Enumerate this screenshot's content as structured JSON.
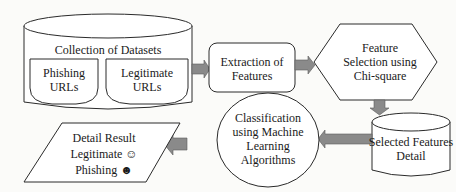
{
  "diagram": {
    "type": "flowchart",
    "colors": {
      "stroke": "#2a2a2a",
      "arrow_fill": "#8a8a8a",
      "background": "#fbfbf9"
    },
    "nodes": {
      "datasets": {
        "title": "Collection of Datasets",
        "shape": "cylinder",
        "children": {
          "phishing": {
            "line1": "Phishing",
            "line2": "URLs"
          },
          "legitimate": {
            "line1": "Legitimate",
            "line2": "URLs"
          }
        }
      },
      "extraction": {
        "line1": "Extraction of",
        "line2": "Features",
        "shape": "rounded-rectangle"
      },
      "selection": {
        "line1": "Feature",
        "line2": "Selection using",
        "line3": "Chi-square",
        "shape": "hexagon"
      },
      "selected": {
        "line1": "Selected Features",
        "line2": "Detail",
        "shape": "cylinder"
      },
      "classification": {
        "line1": "Classification",
        "line2": "using Machine",
        "line3": "Learning",
        "line4": "Algorithms",
        "shape": "ellipse"
      },
      "result": {
        "line1": "Detail Result",
        "line2": "Legitimate",
        "line2_icon": "☺",
        "line3": "Phishing",
        "line3_icon": "☻",
        "shape": "parallelogram"
      }
    },
    "edges": [
      {
        "from": "datasets",
        "to": "extraction"
      },
      {
        "from": "extraction",
        "to": "selection"
      },
      {
        "from": "selection",
        "to": "selected"
      },
      {
        "from": "selected",
        "to": "classification"
      },
      {
        "from": "classification",
        "to": "result"
      }
    ]
  }
}
